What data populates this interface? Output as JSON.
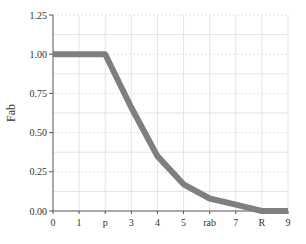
{
  "chart_data": {
    "type": "line",
    "title": "",
    "xlabel": "",
    "ylabel": "Fab",
    "x": [
      0,
      1,
      2,
      3,
      4,
      5,
      6,
      7,
      8,
      9
    ],
    "x_tick_labels": [
      "0",
      "1",
      "p",
      "3",
      "4",
      "5",
      "rab",
      "7",
      "R",
      "9"
    ],
    "y_tick_values": [
      0,
      0.25,
      0.5,
      0.75,
      1.0,
      1.25
    ],
    "y_tick_labels": [
      "0.00",
      "0.25",
      "0.50",
      "0.75",
      "1.00",
      "1.25"
    ],
    "series": [
      {
        "name": "Fab",
        "values": [
          1.0,
          1.0,
          1.0,
          0.66,
          0.35,
          0.17,
          0.08,
          0.04,
          0.0,
          0.0
        ],
        "color": "#7f7f7f"
      }
    ],
    "xlim": [
      0,
      9
    ],
    "ylim": [
      0,
      1.25
    ],
    "grid": true,
    "legend": "none"
  },
  "colors": {
    "line": "#7f7f7f",
    "axis": "#555555",
    "grid": "#e4e4e4"
  }
}
